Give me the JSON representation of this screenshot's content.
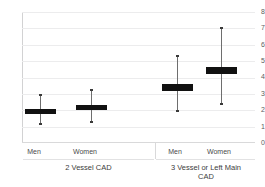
{
  "chart_data": {
    "type": "box",
    "title": "",
    "xlabel": "",
    "ylabel": "",
    "ylim": [
      0,
      8
    ],
    "y_ticks": [
      "0",
      "1",
      "2",
      "3",
      "4",
      "5",
      "6",
      "7",
      "8"
    ],
    "grid": true,
    "legend": "none",
    "categories": [
      "Men",
      "Women",
      "Men",
      "Women"
    ],
    "groups": [
      {
        "label": "2 Vessel CAD",
        "items": [
          {
            "category": "Men",
            "estimate": 1.95,
            "box_low": 1.85,
            "box_high": 2.05,
            "whisker_low": 1.1,
            "whisker_high": 3.0
          },
          {
            "category": "Women",
            "estimate": 2.15,
            "box_low": 2.0,
            "box_high": 2.3,
            "whisker_low": 1.2,
            "whisker_high": 3.3
          }
        ]
      },
      {
        "label": "3 Vessel or Left Main CAD",
        "items": [
          {
            "category": "Men",
            "estimate": 3.4,
            "box_low": 3.2,
            "box_high": 3.6,
            "whisker_low": 1.9,
            "whisker_high": 5.4
          },
          {
            "category": "Women",
            "estimate": 4.4,
            "box_low": 4.2,
            "box_high": 4.65,
            "whisker_low": 2.35,
            "whisker_high": 7.1
          }
        ]
      }
    ],
    "colors": {
      "box": "#111111",
      "whisker": "#6e6e6e",
      "gridline": "#ececed",
      "axis": "#d2d2d3",
      "text": "#4a4a4a",
      "background": "#ffffff"
    }
  },
  "axis": {
    "tick_0": "0",
    "tick_1": "1",
    "tick_2": "2",
    "tick_3": "3",
    "tick_4": "4",
    "tick_5": "5",
    "tick_6": "6",
    "tick_7": "7",
    "tick_8": "8"
  },
  "labels": {
    "g1_men": "Men",
    "g1_women": "Women",
    "g2_men": "Men",
    "g2_women": "Women",
    "group1": "2 Vessel CAD",
    "group2_line1": "3 Vessel or Left Main",
    "group2_line2": "CAD"
  }
}
